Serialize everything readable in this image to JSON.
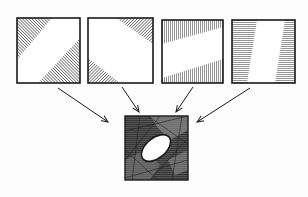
{
  "figure": {
    "colors": {
      "ink": "#1a1a1a",
      "paper": "#fdfdfd",
      "hatch": "#3a3a3a"
    },
    "panels": [
      {
        "id": "panel-1",
        "hatch": "diagonal"
      },
      {
        "id": "panel-2",
        "hatch": "diagonal"
      },
      {
        "id": "panel-3",
        "hatch": "vertical"
      },
      {
        "id": "panel-4",
        "hatch": "horizontal"
      }
    ],
    "result": {
      "id": "combined",
      "shape": "ellipse"
    },
    "arrows": 4
  }
}
